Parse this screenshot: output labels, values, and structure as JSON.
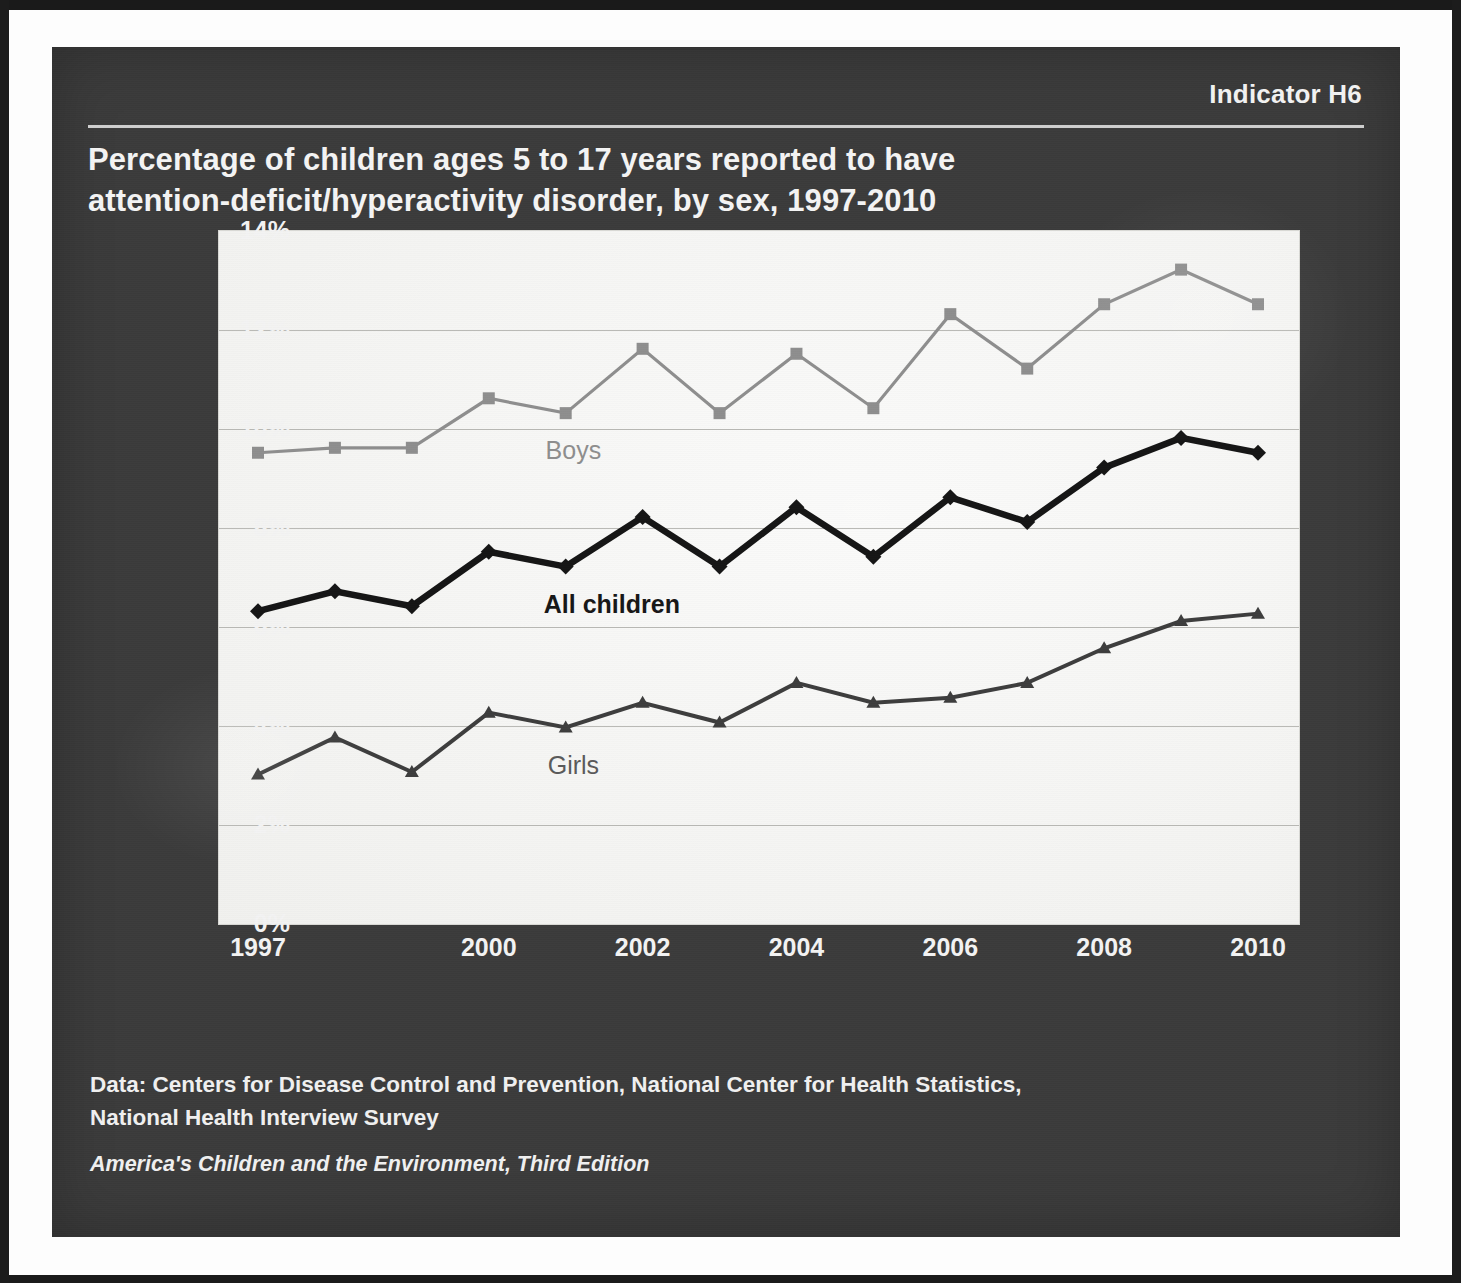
{
  "indicator": "Indicator H6",
  "title_line1": "Percentage of children ages 5 to 17 years reported to have",
  "title_line2": "attention-deficit/hyperactivity disorder, by sex, 1997-2010",
  "footer": {
    "source_line1": "Data: Centers for Disease Control and Prevention, National Center for Health Statistics,",
    "source_line2": "National Health Interview Survey",
    "edition": "America's Children and the Environment, Third Edition"
  },
  "colors": {
    "panel_background": "#3b3b3b",
    "plot_background": "#f4f4f2",
    "gridline": "#b9b9b5",
    "boys": "#8e8e8e",
    "all_children": "#151515",
    "girls": "#3d3d3d",
    "text_light": "#f3f3f3"
  },
  "axis": {
    "y_ticks": [
      "0%",
      "2%",
      "4%",
      "6%",
      "8%",
      "10%",
      "12%",
      "14%"
    ],
    "x_ticks": [
      "1997",
      "2000",
      "2002",
      "2004",
      "2006",
      "2008",
      "2010"
    ]
  },
  "series_labels": {
    "boys": "Boys",
    "all_children": "All children",
    "girls": "Girls"
  },
  "chart_data": {
    "type": "line",
    "title": "Percentage of children ages 5 to 17 years reported to have attention-deficit/hyperactivity disorder, by sex, 1997-2010",
    "xlabel": "",
    "ylabel": "Percent",
    "x": [
      1997,
      1998,
      1999,
      2000,
      2001,
      2002,
      2003,
      2004,
      2005,
      2006,
      2007,
      2008,
      2009,
      2010
    ],
    "xlim": [
      1997,
      2010
    ],
    "ylim": [
      0,
      14
    ],
    "ytick_values": [
      0,
      2,
      4,
      6,
      8,
      10,
      12,
      14
    ],
    "ytick_labels": [
      "0%",
      "2%",
      "4%",
      "6%",
      "8%",
      "10%",
      "12%",
      "14%"
    ],
    "xtick_values": [
      1997,
      2000,
      2002,
      2004,
      2006,
      2008,
      2010
    ],
    "xtick_labels": [
      "1997",
      "2000",
      "2002",
      "2004",
      "2006",
      "2008",
      "2010"
    ],
    "grid": "horizontal",
    "legend": "inline-labels",
    "series": [
      {
        "name": "Boys",
        "marker": "square",
        "color": "#8e8e8e",
        "values": [
          9.5,
          9.6,
          9.6,
          10.6,
          10.3,
          11.6,
          10.3,
          11.5,
          10.4,
          12.3,
          11.2,
          12.5,
          13.2,
          12.5
        ]
      },
      {
        "name": "All children",
        "marker": "diamond",
        "color": "#151515",
        "values": [
          6.3,
          6.7,
          6.4,
          7.5,
          7.2,
          8.2,
          7.2,
          8.4,
          7.4,
          8.6,
          8.1,
          9.2,
          9.8,
          9.5
        ]
      },
      {
        "name": "Girls",
        "marker": "triangle",
        "color": "#3d3d3d",
        "values": [
          3.0,
          3.75,
          3.05,
          4.25,
          3.95,
          4.45,
          4.05,
          4.85,
          4.45,
          4.55,
          4.85,
          5.55,
          6.1,
          6.25
        ]
      }
    ],
    "annotations": [
      {
        "text": "Boys",
        "x": 2001.1,
        "y": 9.55
      },
      {
        "text": "All children",
        "x": 2001.6,
        "y": 6.45
      },
      {
        "text": "Girls",
        "x": 2001.1,
        "y": 3.2
      }
    ]
  }
}
